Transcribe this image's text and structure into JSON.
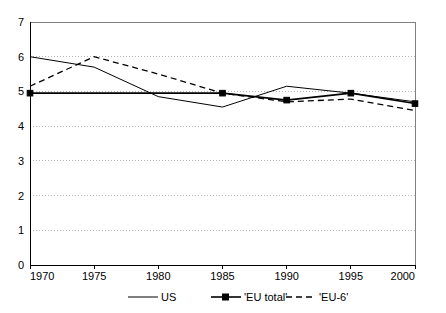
{
  "chart_data": {
    "type": "line",
    "title": "",
    "subtitle": "",
    "xlabel": "",
    "ylabel": "",
    "x": [
      1970,
      1975,
      1980,
      1985,
      1990,
      1995,
      2000
    ],
    "xlim": [
      1970,
      2000
    ],
    "ylim": [
      0,
      7
    ],
    "xticks": [
      "1970",
      "1975",
      "1980",
      "1985",
      "1990",
      "1995",
      "2000"
    ],
    "yticks": [
      "0",
      "1",
      "2",
      "3",
      "4",
      "5",
      "6",
      "7"
    ],
    "grid": "horizontal-dotted",
    "legend_position": "bottom",
    "series": [
      {
        "name": "US",
        "style": "solid",
        "marker": "none",
        "color": "#000000",
        "values": [
          6.0,
          5.7,
          4.85,
          4.55,
          5.15,
          4.95,
          4.7
        ]
      },
      {
        "name": "'EU total'",
        "style": "solid",
        "marker": "square",
        "color": "#000000",
        "values": [
          4.95,
          null,
          null,
          4.95,
          4.75,
          4.95,
          4.65
        ]
      },
      {
        "name": "'EU-6'",
        "style": "dashed",
        "marker": "none",
        "color": "#000000",
        "values": [
          5.15,
          6.0,
          5.5,
          4.95,
          4.7,
          4.78,
          4.45
        ]
      }
    ]
  },
  "axes": {
    "y_tick_labels": [
      "7",
      "6",
      "5",
      "4",
      "3",
      "2",
      "1",
      "0"
    ],
    "x_tick_labels": [
      "1970",
      "1975",
      "1980",
      "1985",
      "1990",
      "1995",
      "2000"
    ]
  },
  "legend": {
    "items": [
      {
        "label": "US",
        "swatch": "line-solid"
      },
      {
        "label": "'EU total'",
        "swatch": "line-solid-marker"
      },
      {
        "label": "'EU-6'",
        "swatch": "line-dashed"
      }
    ]
  }
}
